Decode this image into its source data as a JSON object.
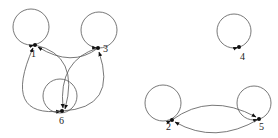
{
  "diagram": {
    "type": "directed-graph",
    "nodes": [
      {
        "id": "1",
        "label": "1",
        "x": 35,
        "y": 45,
        "lx": 31,
        "ly": 57,
        "loop": {
          "cx": 31,
          "cy": 27,
          "r": 18
        }
      },
      {
        "id": "3",
        "label": "3",
        "x": 98,
        "y": 48,
        "lx": 103,
        "ly": 52,
        "loop": {
          "cx": 99,
          "cy": 30,
          "r": 18
        }
      },
      {
        "id": "6",
        "label": "6",
        "x": 62,
        "y": 111,
        "lx": 59,
        "ly": 124,
        "loop": {
          "cx": 60,
          "cy": 96,
          "r": 17
        }
      },
      {
        "id": "4",
        "label": "4",
        "x": 239,
        "y": 47,
        "lx": 240,
        "ly": 60,
        "loop": {
          "cx": 234,
          "cy": 31,
          "r": 17
        }
      },
      {
        "id": "2",
        "label": "2",
        "x": 172,
        "y": 120,
        "lx": 166,
        "ly": 130,
        "loop": {
          "cx": 163,
          "cy": 103,
          "r": 18
        }
      },
      {
        "id": "5",
        "label": "5",
        "x": 259,
        "y": 119,
        "lx": 259,
        "ly": 130,
        "loop": {
          "cx": 254,
          "cy": 103,
          "r": 17
        }
      }
    ],
    "edges": [
      {
        "from": "1",
        "to": "1",
        "kind": "self-loop"
      },
      {
        "from": "3",
        "to": "3",
        "kind": "self-loop"
      },
      {
        "from": "4",
        "to": "4",
        "kind": "self-loop"
      },
      {
        "from": "6",
        "to": "6",
        "kind": "self-loop"
      },
      {
        "from": "2",
        "to": "2",
        "kind": "self-loop"
      },
      {
        "from": "5",
        "to": "5",
        "kind": "self-loop"
      },
      {
        "from": "3",
        "to": "1",
        "path": "M98,48 Q72,68 38,47"
      },
      {
        "from": "1",
        "to": "6",
        "path": "M35,45 Q80,55 65,109"
      },
      {
        "from": "3",
        "to": "6",
        "path": "M98,48 Q58,60 63,108"
      },
      {
        "from": "6",
        "to": "1",
        "path": "M62,111 Q2,118 33,48"
      },
      {
        "from": "6",
        "to": "3",
        "path": "M62,111 Q118,108 99,52"
      },
      {
        "from": "2",
        "to": "5",
        "path": "M172,120 Q210,92 256,117"
      },
      {
        "from": "5",
        "to": "2",
        "path": "M259,119 Q215,145 175,122"
      }
    ]
  }
}
